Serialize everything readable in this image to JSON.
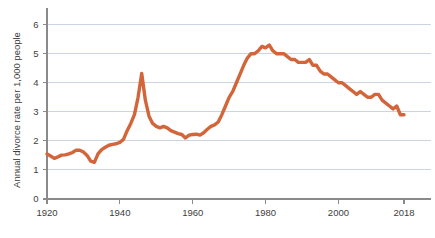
{
  "chart_data": {
    "type": "line",
    "title": "",
    "subtitle": "",
    "xlabel": "",
    "ylabel": "Annual divorce rate per 1,000 people",
    "xlim": [
      1920,
      2018
    ],
    "ylim": [
      0,
      6.4
    ],
    "grid": "horizontal",
    "legend": "none",
    "line_color": "#d2653a",
    "line_width": 3.4,
    "x_ticks": [
      1920,
      1940,
      1960,
      1980,
      2000,
      2018
    ],
    "x_tick_labels": [
      "1920",
      "1940",
      "1960",
      "1980",
      "2000",
      "2018"
    ],
    "y_ticks": [
      0,
      1,
      2,
      3,
      4,
      5,
      6
    ],
    "y_tick_labels": [
      "0",
      "1",
      "2",
      "3",
      "4",
      "5",
      "6"
    ],
    "gridline_values": [
      1,
      2,
      3,
      4,
      5,
      6
    ],
    "series": [
      {
        "name": "Annual divorce rate per 1,000 people",
        "x": [
          1920,
          1921,
          1922,
          1923,
          1924,
          1925,
          1926,
          1927,
          1928,
          1929,
          1930,
          1931,
          1932,
          1933,
          1934,
          1935,
          1936,
          1937,
          1938,
          1939,
          1940,
          1941,
          1942,
          1943,
          1944,
          1945,
          1946,
          1947,
          1948,
          1949,
          1950,
          1951,
          1952,
          1953,
          1954,
          1955,
          1956,
          1957,
          1958,
          1959,
          1960,
          1961,
          1962,
          1963,
          1964,
          1965,
          1966,
          1967,
          1968,
          1969,
          1970,
          1971,
          1972,
          1973,
          1974,
          1975,
          1976,
          1977,
          1978,
          1979,
          1980,
          1981,
          1982,
          1983,
          1984,
          1985,
          1986,
          1987,
          1988,
          1989,
          1990,
          1991,
          1992,
          1993,
          1994,
          1995,
          1996,
          1997,
          1998,
          1999,
          2000,
          2001,
          2002,
          2003,
          2004,
          2005,
          2006,
          2007,
          2008,
          2009,
          2010,
          2011,
          2012,
          2013,
          2014,
          2015,
          2016,
          2017,
          2018
        ],
        "values": [
          1.55,
          1.48,
          1.4,
          1.45,
          1.51,
          1.52,
          1.55,
          1.6,
          1.68,
          1.68,
          1.62,
          1.5,
          1.3,
          1.26,
          1.55,
          1.7,
          1.78,
          1.85,
          1.88,
          1.9,
          1.95,
          2.05,
          2.35,
          2.6,
          2.9,
          3.5,
          4.32,
          3.4,
          2.85,
          2.6,
          2.5,
          2.45,
          2.5,
          2.45,
          2.35,
          2.3,
          2.25,
          2.22,
          2.1,
          2.2,
          2.22,
          2.23,
          2.2,
          2.28,
          2.4,
          2.5,
          2.55,
          2.65,
          2.9,
          3.2,
          3.5,
          3.7,
          4.0,
          4.3,
          4.6,
          4.85,
          5.0,
          5.0,
          5.1,
          5.25,
          5.2,
          5.3,
          5.1,
          5.0,
          5.0,
          5.0,
          4.9,
          4.8,
          4.8,
          4.7,
          4.7,
          4.7,
          4.8,
          4.6,
          4.6,
          4.4,
          4.3,
          4.3,
          4.2,
          4.1,
          4.0,
          4.0,
          3.9,
          3.8,
          3.7,
          3.6,
          3.7,
          3.6,
          3.5,
          3.5,
          3.6,
          3.6,
          3.4,
          3.3,
          3.2,
          3.1,
          3.2,
          2.9,
          2.9
        ]
      }
    ]
  }
}
